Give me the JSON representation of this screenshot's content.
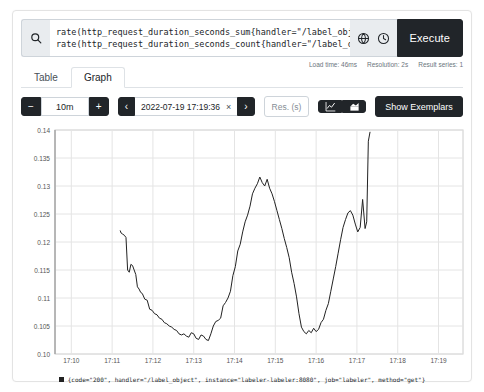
{
  "query": {
    "line1": "rate(http_request_duration_seconds_sum{handler=\"/label_object\"}[1m]) /",
    "line2": "rate(http_request_duration_seconds_count{handler=\"/label_object\"}[1m])",
    "search_icon": "search-icon",
    "metrics_explorer_icon": "globe-icon",
    "history_icon": "clock-icon",
    "execute_label": "Execute"
  },
  "meta": {
    "load_time": "Load time: 46ms",
    "resolution": "Resolution: 2s",
    "result_series": "Result series: 1"
  },
  "tabs": [
    {
      "label": "Table",
      "active": false
    },
    {
      "label": "Graph",
      "active": true
    }
  ],
  "controls": {
    "decrease_label": "−",
    "range_value": "10m",
    "increase_label": "+",
    "prev_label": "‹",
    "time_value": "2022-07-19 17:19:36",
    "clear_label": "×",
    "next_label": "›",
    "resolution_placeholder": "Res. (s)",
    "resolution_value": "",
    "line_chart_icon": "line-chart-icon",
    "stacked_chart_icon": "stacked-chart-icon",
    "show_exemplars_label": "Show Exemplars"
  },
  "legend": {
    "label": "{code=\"200\", handler=\"/label_object\", instance=\"labeler-labeler:8080\", job=\"labeler\", method=\"get\"}",
    "color": "#222222"
  },
  "chart_data": {
    "type": "line",
    "title": "",
    "xlabel": "",
    "ylabel": "",
    "grid": true,
    "legend_position": "bottom",
    "ylim": [
      0.1,
      0.14
    ],
    "yticks": [
      0.1,
      0.105,
      0.11,
      0.115,
      0.12,
      0.125,
      0.13,
      0.135,
      0.14
    ],
    "ytick_labels": [
      "0.10",
      "0.105",
      "0.11",
      "0.115",
      "0.12",
      "0.125",
      "0.13",
      "0.135",
      "0.14"
    ],
    "xlim": [
      "17:09:36",
      "17:19:36"
    ],
    "xticks": [
      "17:10",
      "17:11",
      "17:12",
      "17:13",
      "17:14",
      "17:15",
      "17:16",
      "17:17",
      "17:18",
      "17:19"
    ],
    "series": [
      {
        "name": "{code=\"200\", handler=\"/label_object\", instance=\"labeler-labeler:8080\", job=\"labeler\", method=\"get\"}",
        "color": "#222222",
        "x": [
          1.6,
          1.62,
          1.66,
          1.7,
          1.74,
          1.78,
          1.82,
          1.86,
          1.9,
          1.94,
          1.98,
          2.02,
          2.06,
          2.1,
          2.14,
          2.2,
          2.26,
          2.32,
          2.38,
          2.44,
          2.5,
          2.56,
          2.62,
          2.68,
          2.74,
          2.8,
          2.86,
          2.92,
          2.98,
          3.04,
          3.1,
          3.16,
          3.22,
          3.28,
          3.34,
          3.4,
          3.46,
          3.52,
          3.58,
          3.64,
          3.7,
          3.76,
          3.82,
          3.88,
          3.94,
          4.0,
          4.06,
          4.12,
          4.18,
          4.24,
          4.3,
          4.36,
          4.42,
          4.48,
          4.54,
          4.6,
          4.66,
          4.72,
          4.78,
          4.84,
          4.9,
          4.96,
          5.02,
          5.08,
          5.14,
          5.2,
          5.26,
          5.32,
          5.38,
          5.44,
          5.5,
          5.56,
          5.62,
          5.68,
          5.74,
          5.8,
          5.86,
          5.92,
          5.98,
          6.04,
          6.1,
          6.16,
          6.22,
          6.28,
          6.34,
          6.4,
          6.46,
          6.52,
          6.58,
          6.64,
          6.7,
          6.76,
          6.82,
          6.88,
          6.94,
          7.0,
          7.06,
          7.12,
          7.18,
          7.24,
          7.3,
          7.36,
          7.42,
          7.48,
          7.54,
          7.6,
          7.64,
          7.68,
          7.72
        ],
        "y": [
          0.122,
          0.1216,
          0.1214,
          0.1212,
          0.1208,
          0.115,
          0.1146,
          0.116,
          0.1158,
          0.115,
          0.1142,
          0.112,
          0.1116,
          0.111,
          0.1108,
          0.1098,
          0.1096,
          0.108,
          0.1078,
          0.1072,
          0.107,
          0.1064,
          0.1062,
          0.1056,
          0.1054,
          0.105,
          0.1048,
          0.1044,
          0.1042,
          0.1036,
          0.1034,
          0.1036,
          0.1032,
          0.103,
          0.1038,
          0.1036,
          0.1028,
          0.1026,
          0.1034,
          0.1032,
          0.1026,
          0.1024,
          0.1036,
          0.105,
          0.1058,
          0.106,
          0.1064,
          0.1086,
          0.1092,
          0.11,
          0.1112,
          0.114,
          0.1156,
          0.1184,
          0.1196,
          0.1218,
          0.1236,
          0.1248,
          0.1264,
          0.1286,
          0.1296,
          0.1304,
          0.1316,
          0.1306,
          0.13,
          0.1312,
          0.1296,
          0.1286,
          0.1272,
          0.1256,
          0.124,
          0.1224,
          0.1206,
          0.119,
          0.1172,
          0.1146,
          0.1126,
          0.1102,
          0.1072,
          0.1048,
          0.104,
          0.1036,
          0.1042,
          0.1038,
          0.1046,
          0.104,
          0.1044,
          0.1056,
          0.1062,
          0.1078,
          0.109,
          0.1112,
          0.1134,
          0.1156,
          0.118,
          0.1204,
          0.1226,
          0.124,
          0.1252,
          0.1256,
          0.1248,
          0.1232,
          0.1218,
          0.1226,
          0.1276,
          0.1224,
          0.1236,
          0.138,
          0.1396
        ]
      }
    ]
  }
}
